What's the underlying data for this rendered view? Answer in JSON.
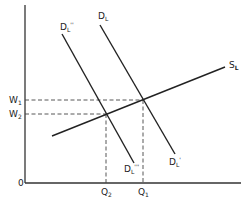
{
  "diagram": {
    "type": "labor-market supply-demand",
    "colors": {
      "line": "#222222",
      "dash": "#444444",
      "background": "#ffffff"
    },
    "axes": {
      "origin_label": "0",
      "x_axis": {
        "from": [
          25,
          183
        ],
        "to": [
          241,
          183
        ]
      },
      "y_axis": {
        "from": [
          25,
          5
        ],
        "to": [
          25,
          183
        ]
      }
    },
    "curves": [
      {
        "id": "SL",
        "label_base": "S",
        "label_sub": "L",
        "label_sup": "",
        "from": [
          52,
          136
        ],
        "to": [
          225,
          67
        ]
      },
      {
        "id": "DL",
        "label_base": "D",
        "label_sub": "L",
        "label_sup": "",
        "end_label_base": "D",
        "end_label_sub": "L",
        "end_label_sup": "'",
        "from": [
          100,
          25
        ],
        "to": [
          175,
          154
        ]
      },
      {
        "id": "DL''",
        "label_base": "D",
        "label_sub": "L",
        "label_sup": "''",
        "end_label_base": "D",
        "end_label_sub": "L",
        "end_label_sup": "'''",
        "from": [
          62,
          34
        ],
        "to": [
          134,
          163
        ]
      }
    ],
    "equilibria": [
      {
        "wage_label": "W",
        "wage_sub": "1",
        "qty_label": "Q",
        "qty_sub": "1",
        "point": [
          143,
          100
        ]
      },
      {
        "wage_label": "W",
        "wage_sub": "2",
        "qty_label": "Q",
        "qty_sub": "2",
        "point": [
          106,
          114
        ]
      }
    ],
    "labels": {
      "origin": "0",
      "w1": "W",
      "w1_sub": "1",
      "w2": "W",
      "w2_sub": "2",
      "q1": "Q",
      "q1_sub": "1",
      "q2": "Q",
      "q2_sub": "2",
      "sl": "S",
      "sl_sub": "L",
      "dl_top": "D",
      "dl_top_sub": "L",
      "dl_bottom": "D",
      "dl_bottom_sub": "L",
      "dl_bottom_sup": "'",
      "dl2_top": "D",
      "dl2_top_sub": "L",
      "dl2_top_sup": "''",
      "dl2_bottom": "D",
      "dl2_bottom_sub": "L",
      "dl2_bottom_sup": "'''"
    }
  }
}
